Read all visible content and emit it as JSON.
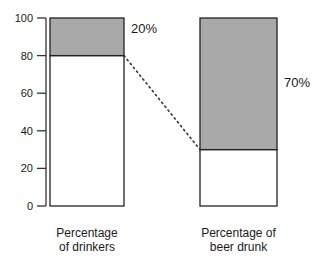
{
  "chart_data": {
    "type": "bar",
    "subtype": "stacked-100-percent",
    "title": "",
    "xlabel": "",
    "ylabel": "",
    "ylim": [
      0,
      100
    ],
    "yticks": [
      0,
      20,
      40,
      60,
      80,
      100
    ],
    "grid": false,
    "categories": [
      "Percentage\nof drinkers",
      "Percentage of\nbeer drunk"
    ],
    "category_lines": [
      [
        "Percentage",
        "of drinkers"
      ],
      [
        "Percentage of",
        "beer drunk"
      ]
    ],
    "series": [
      {
        "name": "lower",
        "color": "#ffffff",
        "values": [
          80,
          30
        ]
      },
      {
        "name": "upper",
        "color": "#a9a9a9",
        "values": [
          20,
          70
        ]
      }
    ],
    "annotations": [
      {
        "bar": 0,
        "text": "20%"
      },
      {
        "bar": 1,
        "text": "70%"
      }
    ],
    "connector": {
      "from": {
        "bar": 0,
        "y": 80
      },
      "to": {
        "bar": 1,
        "y": 30
      },
      "style": "dotted"
    }
  }
}
